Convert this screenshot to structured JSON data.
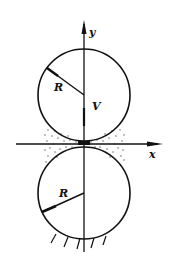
{
  "diagram": {
    "type": "two-roller contact (squeeze film) diagram",
    "axes": {
      "y_label": "y",
      "x_label": "x"
    },
    "upper_roller": {
      "radius_label": "R",
      "velocity_label": "V"
    },
    "lower_roller": {
      "radius_label": "R",
      "support": "fixed (hatched ground)"
    },
    "contact_region": "dotted lubricant/fluid film between rollers",
    "colors": {
      "line": "#111111",
      "background": "#ffffff",
      "dots": "#555555"
    }
  }
}
